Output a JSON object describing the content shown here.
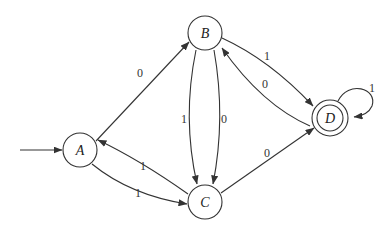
{
  "diagram": {
    "type": "finite-automaton",
    "start_state": "A",
    "accepting_states": [
      "D"
    ],
    "states": [
      {
        "id": "A",
        "label": "A",
        "x": 80,
        "y": 150,
        "accepting": false
      },
      {
        "id": "B",
        "label": "B",
        "x": 205,
        "y": 33,
        "accepting": false
      },
      {
        "id": "C",
        "label": "C",
        "x": 205,
        "y": 202,
        "accepting": false
      },
      {
        "id": "D",
        "label": "D",
        "x": 330,
        "y": 118,
        "accepting": true
      }
    ],
    "transitions": [
      {
        "from": "A",
        "to": "B",
        "label": "0"
      },
      {
        "from": "B",
        "to": "D",
        "label": "1"
      },
      {
        "from": "D",
        "to": "B",
        "label": "0"
      },
      {
        "from": "D",
        "to": "D",
        "label": "1"
      },
      {
        "from": "B",
        "to": "C",
        "label": "1"
      },
      {
        "from": "B",
        "to": "C",
        "label": "0"
      },
      {
        "from": "C",
        "to": "A",
        "label": "1"
      },
      {
        "from": "A",
        "to": "C",
        "label": "1"
      },
      {
        "from": "C",
        "to": "D",
        "label": "0"
      }
    ],
    "colors": {
      "stroke": "#333333",
      "background": "#ffffff"
    }
  }
}
